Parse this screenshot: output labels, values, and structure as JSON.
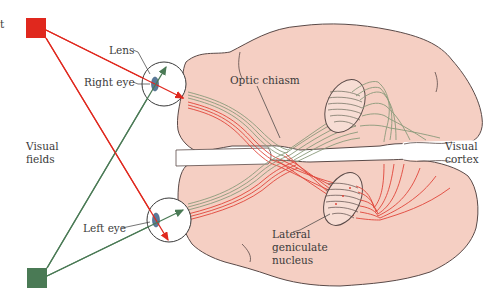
{
  "labels": {
    "lens": "Lens",
    "right_eye": "Right eye",
    "left_eye": "Left eye",
    "visual_fields_line1": "Visual",
    "visual_fields_line2": "fields",
    "optic_chiasm": "Optic chiasm",
    "visual_cortex_line1": "Visual",
    "visual_cortex_line2": "cortex",
    "lgn_line1": "Lateral",
    "lgn_line2": "geniculate",
    "lgn_line3": "nucleus",
    "cut_off_text": "t"
  },
  "colors": {
    "red_field": "#e0281e",
    "green_field": "#4a7a55",
    "red_fiber": "#e0453a",
    "green_fiber": "#8a9a7a",
    "brain_fill": "#f5cfc3",
    "brain_outline": "#5a4a48",
    "lens": "#5a7a9a",
    "text": "#3a3a3a"
  },
  "stimuli": [
    {
      "name": "red-square",
      "color": "red",
      "position": "top-left"
    },
    {
      "name": "green-square",
      "color": "green",
      "position": "bottom-left"
    }
  ]
}
